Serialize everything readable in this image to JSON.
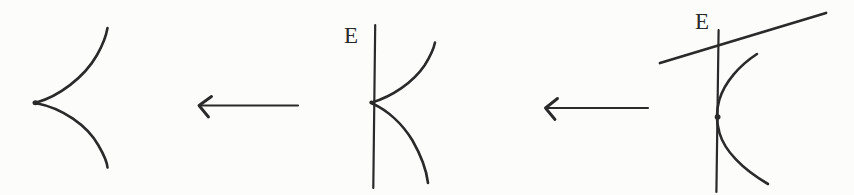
{
  "colors": {
    "ink": "#2a2a2a",
    "paper": "#fcfcfb"
  },
  "figures": {
    "left_cusp": {
      "description_label": ""
    },
    "middle_cusp": {
      "line_label": "E"
    },
    "right_curve": {
      "line_label": "E"
    }
  },
  "arrows": {
    "first": {
      "direction": "left"
    },
    "second": {
      "direction": "left"
    }
  }
}
